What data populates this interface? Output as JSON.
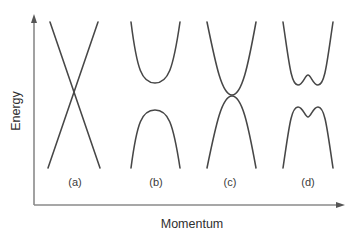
{
  "figure": {
    "title": "",
    "background_color": "#ffffff",
    "curve_color": "#474747",
    "axis_color": "#8a8a8a",
    "label_color": "#2f2f2f"
  },
  "axes": {
    "y_label": "Energy",
    "x_label": "Momentum",
    "y_arrow": "arrow-up-icon",
    "x_arrow": "arrow-right-icon",
    "origin_x": 34,
    "origin_y": 205,
    "y_top": 16,
    "x_right": 344
  },
  "panels": [
    {
      "id": "a",
      "label": "(a)",
      "label_x": 75,
      "label_y": 186,
      "description": "linear crossing bands",
      "type": "dirac-cone"
    },
    {
      "id": "b",
      "label": "(b)",
      "label_x": 156,
      "label_y": 186,
      "description": "gapped parabolic bands",
      "type": "gapped-parabolic"
    },
    {
      "id": "c",
      "label": "(c)",
      "label_x": 230,
      "label_y": 186,
      "description": "tangentially touching bands",
      "type": "zero-gap-touching"
    },
    {
      "id": "d",
      "label": "(d)",
      "label_x": 308,
      "label_y": 186,
      "description": "mexican hat camelback bands",
      "type": "mexican-hat"
    }
  ],
  "chart_data": {
    "type": "line",
    "title": "",
    "xlabel": "Momentum",
    "ylabel": "Energy",
    "grid": false,
    "legend": "none",
    "axis_ticks": "none",
    "note": "Four schematic electronic band-structure panels drawn as unitless dispersion curves; axes are unlabelled arrows with no numeric ticks.",
    "series": [
      {
        "name": "a-upper-right-line",
        "panel": "a",
        "shape": "straight-line",
        "path": "M 50 22 L 100 168"
      },
      {
        "name": "a-upper-left-line",
        "panel": "a",
        "shape": "straight-line",
        "path": "M 98 22 L 48 168"
      },
      {
        "name": "b-conduction-band",
        "panel": "b",
        "shape": "parabola-up",
        "path": "M 131 22 C 137 70, 142 83, 155 83 C 168 83, 173 70, 180 22"
      },
      {
        "name": "b-valence-band",
        "panel": "b",
        "shape": "parabola-down",
        "path": "M 131 168 C 137 122, 142 110, 155 110 C 168 110, 173 122, 180 168"
      },
      {
        "name": "c-conduction-band",
        "panel": "c",
        "shape": "parabola-up-touching",
        "path": "M 207 22 C 216 66, 222 95, 232 95 C 242 95, 248 66, 256 22"
      },
      {
        "name": "c-valence-band",
        "panel": "c",
        "shape": "parabola-down-touching",
        "path": "M 207 168 C 216 124, 222 96, 232 96 C 242 96, 248 124, 256 168"
      },
      {
        "name": "d-conduction-band",
        "panel": "d",
        "shape": "mexican-hat-up",
        "path": "M 283 22 C 289 62, 291 85, 298 85 C 303 85, 305 75, 308 75 C 311 75, 313 85, 318 85 C 325 85, 327 62, 333 22"
      },
      {
        "name": "d-valence-band",
        "panel": "d",
        "shape": "mexican-hat-down",
        "path": "M 283 168 C 289 128, 291 107, 298 107 C 303 107, 305 117, 308 117 C 311 117, 313 107, 318 107 C 325 107, 327 128, 333 168"
      }
    ]
  }
}
